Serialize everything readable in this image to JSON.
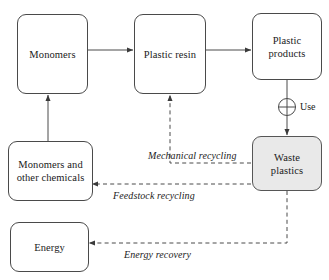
{
  "diagram": {
    "background_color": "#ffffff",
    "line_color": "#4a4a4a",
    "shaded_fill": "#e9e9e9",
    "nodes": [
      {
        "id": "monomers",
        "label": "Monomers",
        "shaded": false
      },
      {
        "id": "plastic-resin",
        "label": "Plastic resin",
        "shaded": false
      },
      {
        "id": "plastic-products",
        "label": "Plastic\nproducts",
        "shaded": false
      },
      {
        "id": "waste-plastics",
        "label": "Waste\nplastics",
        "shaded": true
      },
      {
        "id": "monomers-other",
        "label": "Monomers and\nother chemicals",
        "shaded": false
      },
      {
        "id": "energy",
        "label": "Energy",
        "shaded": false
      }
    ],
    "node_labels": {
      "monomers": "Monomers",
      "plastic_resin": "Plastic resin",
      "plastic_products_line1": "Plastic",
      "plastic_products_line2": "products",
      "waste_plastics_line1": "Waste",
      "waste_plastics_line2": "plastics",
      "monomers_other_line1": "Monomers and",
      "monomers_other_line2": "other chemicals",
      "energy": "Energy"
    },
    "edge_labels": {
      "use": "Use",
      "mechanical_recycling": "Mechanical recycling",
      "feedstock_recycling": "Feedstock recycling",
      "energy_recovery": "Energy recovery"
    },
    "edges": [
      {
        "from": "monomers",
        "to": "plastic-resin",
        "style": "solid",
        "label": ""
      },
      {
        "from": "plastic-resin",
        "to": "plastic-products",
        "style": "solid",
        "label": ""
      },
      {
        "from": "plastic-products",
        "to": "waste-plastics",
        "style": "solid",
        "label": "Use",
        "junction": "circle-plus"
      },
      {
        "from": "waste-plastics",
        "to": "plastic-resin",
        "style": "dashed",
        "label": "Mechanical recycling"
      },
      {
        "from": "waste-plastics",
        "to": "monomers-other",
        "style": "dashed",
        "label": "Feedstock recycling"
      },
      {
        "from": "waste-plastics",
        "to": "energy",
        "style": "dashed",
        "label": "Energy recovery"
      },
      {
        "from": "monomers-other",
        "to": "monomers",
        "style": "solid",
        "label": ""
      }
    ]
  }
}
